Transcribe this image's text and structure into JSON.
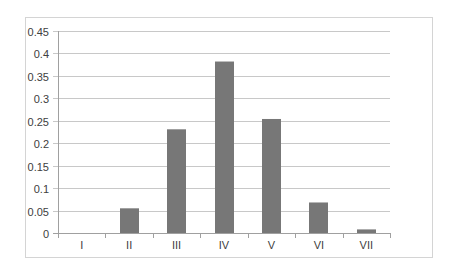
{
  "chart_data": {
    "type": "bar",
    "title": "",
    "xlabel": "",
    "ylabel": "",
    "categories": [
      "I",
      "II",
      "III",
      "IV",
      "V",
      "VI",
      "VII"
    ],
    "values": [
      0,
      0.055,
      0.231,
      0.382,
      0.254,
      0.068,
      0.008
    ],
    "ylim": [
      0,
      0.45
    ],
    "yticks": [
      "0",
      "0.05",
      "0.1",
      "0.15",
      "0.2",
      "0.25",
      "0.3",
      "0.35",
      "0.4",
      "0.45"
    ],
    "grid": true,
    "legend": null,
    "bar_color": "#777777",
    "gridline_color": "#c8c8c8",
    "axis_color": "#a0a0a0",
    "border_color": "#d4d4d4"
  }
}
